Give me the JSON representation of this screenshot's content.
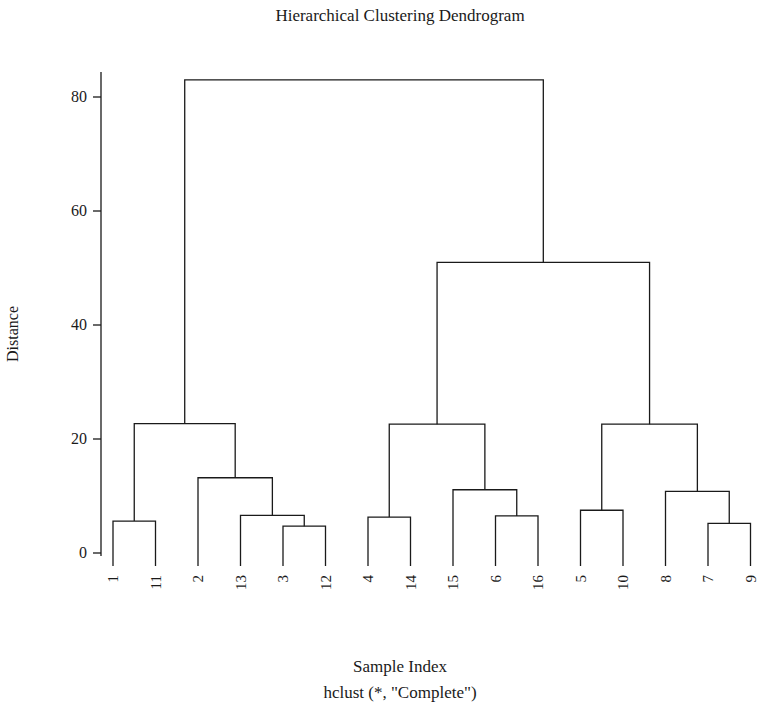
{
  "figure": {
    "title": "Hierarchical Clustering Dendrogram",
    "xlabel": "Sample Index",
    "caption": "hclust (*, \"Complete\")",
    "ylabel": "Distance",
    "line_color": "#1a1a1a",
    "background": "#ffffff"
  },
  "chart_data": {
    "type": "dendrogram",
    "title": "Hierarchical Clustering Dendrogram",
    "xlabel": "Sample Index",
    "ylabel": "Distance",
    "subtitle": "hclust (*, \"Complete\")",
    "linkage": "Complete",
    "grid": false,
    "legend": "none",
    "ylim": [
      0,
      87
    ],
    "yticks": [
      0,
      20,
      40,
      60,
      80
    ],
    "ytick_labels": [
      "0",
      "20",
      "40",
      "60",
      "80"
    ],
    "leaf_order": [
      "1",
      "11",
      "2",
      "13",
      "3",
      "12",
      "4",
      "14",
      "15",
      "6",
      "16",
      "5",
      "10",
      "8",
      "7",
      "9"
    ],
    "n_leaves": 16,
    "merges": [
      {
        "id": "m1",
        "left": "1",
        "right": "11",
        "height": 5.6
      },
      {
        "id": "m2",
        "left": "3",
        "right": "12",
        "height": 4.7
      },
      {
        "id": "m3",
        "left": "13",
        "right": "m2",
        "height": 6.6
      },
      {
        "id": "m4",
        "left": "2",
        "right": "m3",
        "height": 13.2
      },
      {
        "id": "m5",
        "left": "m1",
        "right": "m4",
        "height": 22.7
      },
      {
        "id": "m6",
        "left": "4",
        "right": "14",
        "height": 6.3
      },
      {
        "id": "m7",
        "left": "6",
        "right": "16",
        "height": 6.5
      },
      {
        "id": "m8",
        "left": "15",
        "right": "m7",
        "height": 11.1
      },
      {
        "id": "m9",
        "left": "m6",
        "right": "m8",
        "height": 22.6
      },
      {
        "id": "m10",
        "left": "5",
        "right": "10",
        "height": 7.5
      },
      {
        "id": "m11",
        "left": "7",
        "right": "9",
        "height": 5.2
      },
      {
        "id": "m12",
        "left": "8",
        "right": "m11",
        "height": 10.8
      },
      {
        "id": "m13",
        "left": "m10",
        "right": "m12",
        "height": 22.6
      },
      {
        "id": "m14",
        "left": "m9",
        "right": "m13",
        "height": 51.0
      },
      {
        "id": "m15",
        "left": "m5",
        "right": "m14",
        "height": 83.0
      }
    ]
  }
}
